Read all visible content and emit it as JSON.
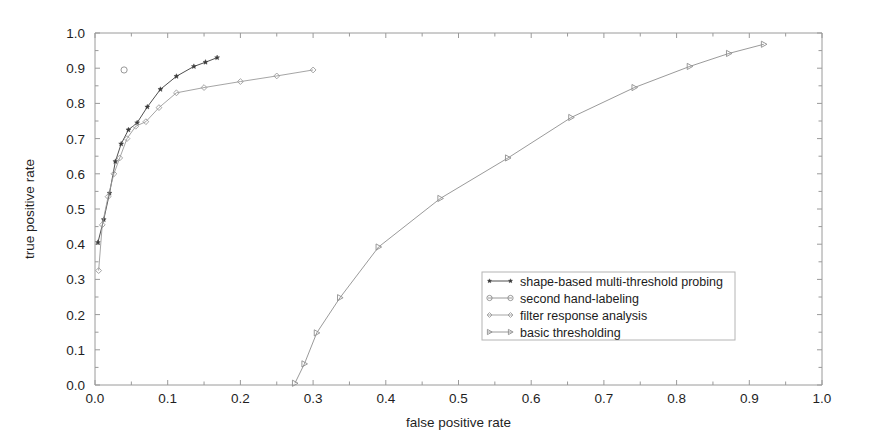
{
  "figure": {
    "width": 872,
    "height": 441,
    "background": "#ffffff"
  },
  "plot_frame": {
    "left": 95,
    "right": 822,
    "top": 33,
    "bottom": 385,
    "frame_color": "#9a9a9a"
  },
  "chart_data": {
    "type": "line",
    "title": "",
    "xlabel": "false positive rate",
    "ylabel": "true positive rate",
    "xlim": [
      0.0,
      1.0
    ],
    "ylim": [
      0.0,
      1.0
    ],
    "xticks": [
      0.0,
      0.1,
      0.2,
      0.3,
      0.4,
      0.5,
      0.6,
      0.7,
      0.8,
      0.9,
      1.0
    ],
    "xtick_labels": [
      "0.0",
      "0.1",
      "0.2",
      "0.3",
      "0.4",
      "0.5",
      "0.6",
      "0.7",
      "0.8",
      "0.9",
      "1.0"
    ],
    "yticks": [
      0.0,
      0.1,
      0.2,
      0.3,
      0.4,
      0.5,
      0.6,
      0.7,
      0.8,
      0.9,
      1.0
    ],
    "ytick_labels": [
      "0.0",
      "0.1",
      "0.2",
      "0.3",
      "0.4",
      "0.5",
      "0.6",
      "0.7",
      "0.8",
      "0.9",
      "1.0"
    ],
    "minor_tick_step": 0.05,
    "grid": false,
    "legend_position": "center-right",
    "series": [
      {
        "name": "shape-based multi-threshold probing",
        "marker": "star-filled",
        "color": "#3b3b3b",
        "x": [
          0.004,
          0.012,
          0.02,
          0.028,
          0.036,
          0.046,
          0.058,
          0.072,
          0.09,
          0.112,
          0.136,
          0.152,
          0.168
        ],
        "y": [
          0.405,
          0.47,
          0.545,
          0.635,
          0.685,
          0.725,
          0.745,
          0.79,
          0.84,
          0.877,
          0.905,
          0.917,
          0.93
        ]
      },
      {
        "name": "second hand-labeling",
        "marker": "circle-open",
        "color": "#8c8c8c",
        "x": [
          0.04
        ],
        "y": [
          0.895
        ]
      },
      {
        "name": "filter response analysis",
        "marker": "diamond-open",
        "color": "#9b9b9b",
        "x": [
          0.005,
          0.01,
          0.018,
          0.026,
          0.034,
          0.044,
          0.056,
          0.07,
          0.088,
          0.112,
          0.15,
          0.2,
          0.25,
          0.3
        ],
        "y": [
          0.325,
          0.455,
          0.535,
          0.6,
          0.645,
          0.7,
          0.735,
          0.748,
          0.788,
          0.83,
          0.845,
          0.862,
          0.878,
          0.895
        ]
      },
      {
        "name": "basic thresholding",
        "marker": "triangle-right-open",
        "color": "#8f8f8f",
        "x": [
          0.275,
          0.288,
          0.305,
          0.337,
          0.39,
          0.475,
          0.568,
          0.655,
          0.742,
          0.818,
          0.872,
          0.92
        ],
        "y": [
          0.005,
          0.06,
          0.148,
          0.248,
          0.392,
          0.53,
          0.645,
          0.76,
          0.845,
          0.905,
          0.942,
          0.968
        ]
      }
    ]
  },
  "legend": {
    "box": {
      "x": 482,
      "y": 272,
      "width": 253,
      "height": 68
    },
    "entries": [
      {
        "label": "shape-based multi-threshold probing",
        "marker": "star-filled",
        "color": "#3b3b3b"
      },
      {
        "label": "second hand-labeling",
        "marker": "circle-open",
        "color": "#8c8c8c"
      },
      {
        "label": "filter response analysis",
        "marker": "diamond-open",
        "color": "#9b9b9b"
      },
      {
        "label": "basic thresholding",
        "marker": "triangle-right-open",
        "color": "#8f8f8f"
      }
    ]
  },
  "axis_labels": {
    "x_title": "false positive rate",
    "y_title": "true positive rate"
  }
}
